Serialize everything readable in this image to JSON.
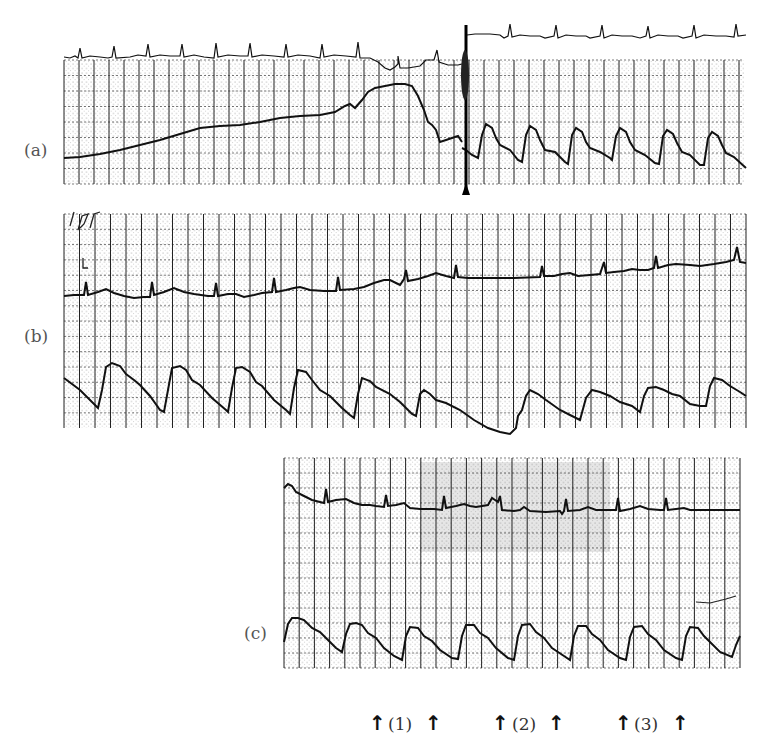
{
  "figure": {
    "panels": [
      {
        "id": "a",
        "label": "(a)"
      },
      {
        "id": "b",
        "label": "(b)"
      },
      {
        "id": "c",
        "label": "(c)"
      }
    ],
    "markers": [
      {
        "label": "(1)"
      },
      {
        "label": "(2)"
      },
      {
        "label": "(3)"
      }
    ],
    "arrow_glyph": "↑"
  },
  "chart_data": [
    {
      "type": "line",
      "panel": "(a)",
      "title": "",
      "xlabel": "",
      "ylabel": "",
      "grid": true,
      "series": [
        {
          "name": "ECG",
          "description": "Regular sinus-like QRS complexes above the grid; baseline steps abruptly upward at the event marker, regular complexes continue afterward"
        },
        {
          "name": "Arterial pressure",
          "description": "Slowly rising pressure trace (no pulsatility) before the event marker, peaks then falls sharply; after the marker a pulsatile waveform with 6 beats appears"
        }
      ],
      "event_marker": "Vertical artifact line with triangle pointer at approx. 57% of strip width",
      "beats_after_marker": 6
    },
    {
      "type": "line",
      "panel": "(b)",
      "title": "",
      "xlabel": "",
      "ylabel": "",
      "grid": true,
      "series": [
        {
          "name": "ECG",
          "description": "Regular QRS complexes, baseline drifting slightly upward from left to right"
        },
        {
          "name": "Arterial pressure",
          "description": "Pulsatile waveform with sharp upstroke, rounded peak, dicrotic notch and gradual decay; 11 beats"
        }
      ],
      "beats": 11
    },
    {
      "type": "line",
      "panel": "(c)",
      "title": "",
      "xlabel": "",
      "ylabel": "",
      "grid": true,
      "series": [
        {
          "name": "ECG",
          "description": "Baseline decays from a high start then steadies; regular QRS complexes"
        },
        {
          "name": "Arterial pressure",
          "description": "Pulsatile waveform with 8 beats"
        }
      ],
      "beats": 8,
      "annotations": [
        "↑ (1) ↑",
        "↑ (2) ↑",
        "↑ (3) ↑"
      ]
    }
  ]
}
